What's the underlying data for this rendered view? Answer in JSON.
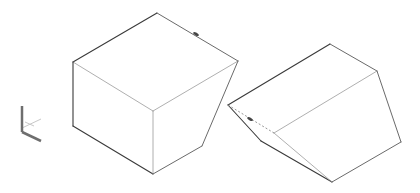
{
  "canvas": {
    "width": 420,
    "height": 193,
    "background": "#ffffff"
  },
  "colors": {
    "edge_dark": "#3a3a3a",
    "edge_mid": "#6a6a6a",
    "edge_light": "#9a9a9a",
    "hidden": "#8a8a8a",
    "axis": "#6e6e6e",
    "axis_light": "#c8c8c8"
  },
  "axis_icon": {
    "name": "ucs-axis-icon",
    "origin": [
      22,
      132
    ],
    "z_end": [
      22,
      106
    ],
    "x_end": [
      41,
      141
    ],
    "y_end": [
      41,
      119
    ]
  },
  "shapes": [
    {
      "name": "truncated-cube-left",
      "vertices": {
        "top": [
          157,
          13
        ],
        "left": [
          73,
          62
        ],
        "right": [
          238,
          61
        ],
        "front": [
          153,
          111
        ],
        "left_bottom": [
          73,
          126
        ],
        "bottom": [
          153,
          174
        ],
        "right_bottom": [
          202,
          146
        ]
      },
      "edges": [
        [
          "top",
          "left",
          "dark"
        ],
        [
          "top",
          "right",
          "mid"
        ],
        [
          "left",
          "front",
          "light"
        ],
        [
          "front",
          "right",
          "light"
        ],
        [
          "left",
          "left_bottom",
          "dark"
        ],
        [
          "left_bottom",
          "bottom",
          "dark"
        ],
        [
          "front",
          "bottom",
          "light"
        ],
        [
          "right",
          "right_bottom",
          "mid"
        ],
        [
          "right_bottom",
          "bottom",
          "mid"
        ]
      ],
      "grip_marker": [
        196,
        34
      ]
    },
    {
      "name": "wedge-right",
      "vertices": {
        "top": [
          330,
          44
        ],
        "right": [
          377,
          71
        ],
        "peak": [
          228,
          105
        ],
        "mid": [
          274,
          133
        ],
        "step": [
          261,
          141
        ],
        "bottom": [
          332,
          182
        ],
        "right_bottom": [
          401,
          142
        ]
      },
      "edges": [
        [
          "peak",
          "top",
          "dark"
        ],
        [
          "top",
          "right",
          "mid"
        ],
        [
          "mid",
          "right",
          "light"
        ],
        [
          "right",
          "right_bottom",
          "mid"
        ],
        [
          "right_bottom",
          "bottom",
          "mid"
        ],
        [
          "peak",
          "step",
          "dark"
        ],
        [
          "step",
          "bottom",
          "dark"
        ],
        [
          "mid",
          "bottom",
          "light"
        ]
      ],
      "hidden_edges": [
        [
          "peak",
          "mid"
        ]
      ],
      "grip_marker": [
        250,
        119
      ]
    }
  ]
}
